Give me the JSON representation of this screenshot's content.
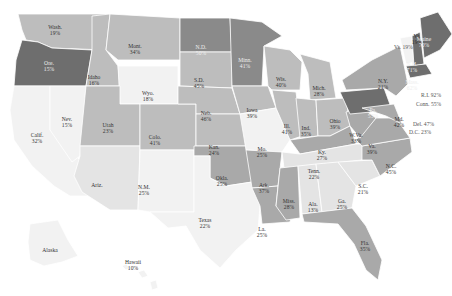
{
  "map": {
    "colors": {
      "c1": "#f2f2f2",
      "c2": "#e4e4e4",
      "c3": "#bdbdbd",
      "c4": "#a9a9a9",
      "c5": "#8a8a8a",
      "c6": "#6e6e6e"
    },
    "states": [
      {
        "id": "wa",
        "name": "Wash.",
        "value": "19%",
        "shade": "c3",
        "path": "M18,14 L110,14 L106,50 L52,48 L38,42 L26,40 L22,30 Z",
        "lx": 55,
        "ly": 30
      },
      {
        "id": "or",
        "name": "Ore.",
        "value": "15%",
        "shade": "c6",
        "path": "M22,40 L38,42 L52,48 L92,50 L86,86 L14,86 L16,60 Z",
        "lx": 49,
        "ly": 66
      },
      {
        "id": "ca",
        "name": "Calif.",
        "value": "32%",
        "shade": "c1",
        "path": "M14,86 L50,86 L50,130 L96,176 L98,196 L70,196 L54,186 L32,166 L14,140 L10,110 Z",
        "lx": 37,
        "ly": 138
      },
      {
        "id": "nv",
        "name": "Nev.",
        "value": "15%",
        "shade": "c1",
        "path": "M50,86 L86,86 L80,156 L72,162 L50,130 Z",
        "lx": 67,
        "ly": 122
      },
      {
        "id": "id",
        "name": "Idaho",
        "value": "16%",
        "shade": "c3",
        "path": "M92,16 L110,14 L106,50 L118,66 L120,86 L86,86 L92,50 Z",
        "lx": 94,
        "ly": 80
      },
      {
        "id": "mt",
        "name": "Mont.",
        "value": "34%",
        "shade": "c3",
        "path": "M110,14 L180,18 L180,60 L118,60 L106,50 Z",
        "lx": 135,
        "ly": 49
      },
      {
        "id": "wy",
        "name": "Wyo.",
        "value": "18%",
        "shade": "c1",
        "path": "M118,66 L178,66 L178,104 L120,104 Z",
        "lx": 148,
        "ly": 96
      },
      {
        "id": "ut",
        "name": "Utah",
        "value": "23%",
        "shade": "c3",
        "path": "M86,86 L120,86 L120,104 L140,104 L140,146 L80,146 Z",
        "lx": 108,
        "ly": 128
      },
      {
        "id": "az",
        "name": "Ariz.",
        "value": "",
        "shade": "c2",
        "path": "M80,146 L140,146 L138,210 L110,210 L82,192 L74,176 L80,156 Z",
        "lx": 97,
        "ly": 185
      },
      {
        "id": "co",
        "name": "Colo.",
        "value": "41%",
        "shade": "c3",
        "path": "M140,104 L196,104 L196,150 L140,150 Z",
        "lx": 155,
        "ly": 140
      },
      {
        "id": "nm",
        "name": "N.M.",
        "value": "25%",
        "shade": "c1",
        "path": "M140,150 L194,150 L194,212 L150,212 L138,210 Z",
        "lx": 144,
        "ly": 190
      },
      {
        "id": "nd",
        "name": "N.D.",
        "value": "50%",
        "shade": "c5",
        "path": "M180,18 L230,18 L232,52 L180,52 Z",
        "lx": 201,
        "ly": 50
      },
      {
        "id": "sd",
        "name": "S.D.",
        "value": "45%",
        "shade": "c3",
        "path": "M180,52 L232,52 L232,88 L180,86 Z",
        "lx": 199,
        "ly": 83
      },
      {
        "id": "ne",
        "name": "Neb.",
        "value": "46%",
        "shade": "c3",
        "path": "M178,86 L232,88 L240,114 L196,114 L196,104 L178,104 Z",
        "lx": 206,
        "ly": 116
      },
      {
        "id": "ks",
        "name": "Kan.",
        "value": "24%",
        "shade": "c3",
        "path": "M196,114 L244,114 L246,146 L196,146 Z",
        "lx": 214,
        "ly": 150
      },
      {
        "id": "ok",
        "name": "Okla.",
        "value": "25%",
        "shade": "c4",
        "path": "M194,146 L248,146 L252,182 L226,186 L210,178 L210,156 L194,156 Z",
        "lx": 222,
        "ly": 181
      },
      {
        "id": "tx",
        "name": "Texas",
        "value": "22%",
        "shade": "c1",
        "path": "M194,156 L210,156 L210,178 L226,186 L252,182 L260,206 L258,230 L236,250 L220,268 L200,250 L186,226 L168,228 L150,212 L194,212 Z",
        "lx": 205,
        "ly": 223
      },
      {
        "id": "mn",
        "name": "Minn.",
        "value": "41%",
        "shade": "c5",
        "path": "M230,18 L262,22 L282,36 L264,46 L262,86 L232,86 Z",
        "lx": 245,
        "ly": 63
      },
      {
        "id": "ia",
        "name": "Iowa",
        "value": "39%",
        "shade": "c3",
        "path": "M232,86 L268,86 L276,108 L240,114 Z",
        "lx": 252,
        "ly": 113
      },
      {
        "id": "mo",
        "name": "Mo.",
        "value": "25%",
        "shade": "c1",
        "path": "M240,114 L276,108 L290,140 L282,152 L246,150 Z",
        "lx": 262,
        "ly": 152
      },
      {
        "id": "ar",
        "name": "Ark.",
        "value": "37%",
        "shade": "c4",
        "path": "M246,150 L282,152 L278,186 L252,188 Z",
        "lx": 264,
        "ly": 188
      },
      {
        "id": "la",
        "name": "La.",
        "value": "25%",
        "shade": "c4",
        "path": "M252,188 L278,186 L276,206 L292,212 L290,222 L262,224 L260,206 Z",
        "lx": 262,
        "ly": 232
      },
      {
        "id": "wi",
        "name": "Wis.",
        "value": "40%",
        "shade": "c3",
        "path": "M264,46 L290,50 L302,62 L300,90 L272,90 L268,86 Z",
        "lx": 281,
        "ly": 82
      },
      {
        "id": "il",
        "name": "Ill.",
        "value": "41%",
        "shade": "c3",
        "path": "M272,90 L296,92 L302,136 L290,140 L276,108 Z",
        "lx": 287,
        "ly": 129
      },
      {
        "id": "mi",
        "name": "Mich.",
        "value": "28%",
        "shade": "c3",
        "path": "M300,54 L330,62 L336,98 L310,100 L308,74 Z",
        "lx": 319,
        "ly": 91
      },
      {
        "id": "in",
        "name": "Ind.",
        "value": "35%",
        "shade": "c3",
        "path": "M296,98 L316,100 L318,136 L300,138 Z",
        "lx": 306,
        "ly": 131
      },
      {
        "id": "oh",
        "name": "Ohio",
        "value": "39%",
        "shade": "c3",
        "path": "M316,100 L346,98 L350,126 L330,136 L318,136 Z",
        "lx": 335,
        "ly": 124
      },
      {
        "id": "ky",
        "name": "Ky.",
        "value": "27%",
        "shade": "c4",
        "path": "M290,140 L318,136 L330,136 L350,126 L356,144 L300,154 Z",
        "lx": 322,
        "ly": 155
      },
      {
        "id": "tn",
        "name": "Tenn.",
        "value": "22%",
        "shade": "c2",
        "path": "M282,152 L300,154 L356,144 L366,144 L362,160 L284,168 Z",
        "lx": 314,
        "ly": 174
      },
      {
        "id": "ms",
        "name": "Miss.",
        "value": "28%",
        "shade": "c4",
        "path": "M280,168 L298,166 L300,218 L286,220 L276,206 Z",
        "lx": 289,
        "ly": 204
      },
      {
        "id": "al",
        "name": "Ala.",
        "value": "13%",
        "shade": "c2",
        "path": "M298,166 L316,164 L322,212 L302,214 Z",
        "lx": 313,
        "ly": 207
      },
      {
        "id": "ga",
        "name": "Ga.",
        "value": "25%",
        "shade": "c2",
        "path": "M316,164 L338,162 L356,186 L352,208 L322,212 Z",
        "lx": 342,
        "ly": 204
      },
      {
        "id": "fl",
        "name": "Fla.",
        "value": "35%",
        "shade": "c4",
        "path": "M302,214 L352,208 L366,226 L382,260 L378,280 L366,270 L354,244 L338,224 L304,222 Z",
        "lx": 365,
        "ly": 246
      },
      {
        "id": "sc",
        "name": "S.C.",
        "value": "21%",
        "shade": "c2",
        "path": "M338,162 L372,160 L380,176 L356,186 Z",
        "lx": 363,
        "ly": 189
      },
      {
        "id": "nc",
        "name": "N.C.",
        "value": "45%",
        "shade": "c4",
        "path": "M362,146 L410,138 L412,152 L380,176 L372,160 L362,160 Z",
        "lx": 391,
        "ly": 169
      },
      {
        "id": "va",
        "name": "Va.",
        "value": "39%",
        "shade": "c4",
        "path": "M356,140 L376,118 L396,118 L410,138 L362,146 Z",
        "lx": 372,
        "ly": 149
      },
      {
        "id": "wv",
        "name": "W.Va.",
        "value": "33%",
        "shade": "c4",
        "path": "M346,112 L362,108 L376,118 L360,138 L350,126 Z",
        "lx": 356,
        "ly": 138
      },
      {
        "id": "pa",
        "name": "Pa.",
        "value": "53%",
        "shade": "c6",
        "path": "M340,92 L384,88 L392,110 L350,114 Z",
        "lx": 373,
        "ly": 113
      },
      {
        "id": "md",
        "name": "Md.",
        "value": "42%",
        "shade": "c4",
        "path": "M362,108 L394,104 L402,124 L386,116 Z",
        "lx": 399,
        "ly": 122
      },
      {
        "id": "ny",
        "name": "N.Y.",
        "value": "21%",
        "shade": "c4",
        "path": "M342,80 L372,60 L400,46 L408,84 L396,96 L384,88 L346,90 Z",
        "lx": 383,
        "ly": 84
      },
      {
        "id": "vt",
        "name": "Vt.",
        "value": "19%",
        "shade": "c1",
        "path": "M400,38 L412,36 L414,62 L406,64 Z",
        "lx": 417,
        "ly": 39
      },
      {
        "id": "nh",
        "name": "N.H.",
        "value": "71%",
        "shade": "c6",
        "path": "M412,36 L420,32 L424,64 L414,66 Z",
        "lx": 412,
        "ly": 67
      },
      {
        "id": "me",
        "name": "Maine",
        "value": "70%",
        "shade": "c6",
        "path": "M420,18 L438,12 L452,34 L440,50 L424,58 Z",
        "lx": 424,
        "ly": 42
      },
      {
        "id": "ma",
        "name": "Mass.",
        "value": "62%",
        "shade": "c6",
        "path": "M406,66 L426,64 L432,74 L410,78 Z",
        "lx": 412,
        "ly": 85
      },
      {
        "id": "ak",
        "name": "Alaska",
        "value": "",
        "shade": "c1",
        "path": "M30,224 L58,220 L68,240 L78,256 L62,262 L44,266 L30,260 L28,242 Z",
        "lx": 50,
        "ly": 250
      },
      {
        "id": "hi",
        "name": "Hawaii",
        "value": "10%",
        "shade": "c1",
        "path": "M122,266 L126,264 L130,268 L126,270 Z M138,272 L144,270 L148,276 L142,278 Z M150,282 L156,280 L158,288 L152,290 Z",
        "lx": 133,
        "ly": 265
      }
    ],
    "outside_labels": [
      {
        "id": "vt-out",
        "text": "Vt. 19%",
        "x": 394,
        "y": 47
      },
      {
        "id": "ri-out",
        "text": "R.I. 92%",
        "x": 421,
        "y": 95
      },
      {
        "id": "ct-out",
        "text": "Conn. 55%",
        "x": 416,
        "y": 104
      },
      {
        "id": "de-out",
        "text": "Del. 47%",
        "x": 413,
        "y": 124
      },
      {
        "id": "dc-out",
        "text": "D.C. 23%",
        "x": 409,
        "y": 132
      }
    ]
  }
}
